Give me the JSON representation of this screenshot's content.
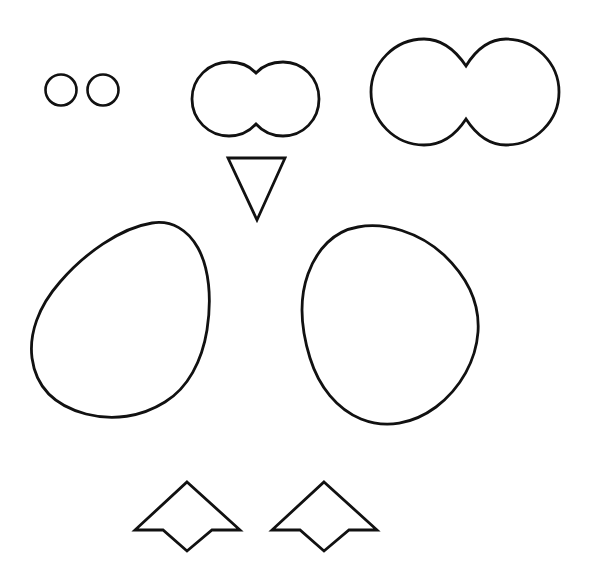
{
  "canvas": {
    "width": 592,
    "height": 586,
    "background": "#ffffff",
    "stroke_color": "#111111",
    "fill_color": "#ffffff",
    "stroke_width": 2.6,
    "title": "Outline Shapes Figure"
  },
  "shapes": [
    {
      "name": "small-circle-left",
      "type": "circle",
      "cx": 61,
      "cy": 90,
      "r": 15.5,
      "stroke_width": 2.6
    },
    {
      "name": "small-circle-right",
      "type": "circle",
      "cx": 103,
      "cy": 90,
      "r": 15.5,
      "stroke_width": 2.6
    },
    {
      "name": "medium-peanut",
      "type": "path",
      "stroke_width": 2.8,
      "d": "M 256 73 C 248 64 238 62 229 62 C 209 62 192 78 192 99 C 192 120 209 136 229 136 C 239 136 248 133 256 124 C 264 133 273 136 283 136 C 303 136 319 120 319 99 C 319 78 303 62 283 62 C 273 62 264 64 256 73 Z"
    },
    {
      "name": "large-peanut",
      "type": "path",
      "stroke_width": 2.8,
      "d": "M 466 66 C 454 48 439 39 424 39 C 395 39 371 63 371 92 C 371 121 395 145 424 145 C 440 145 455 136 466 119 C 477 136 491 145 506 145 C 535 145 559 121 559 92 C 559 63 535 39 506 39 C 491 39 477 48 466 66 Z"
    },
    {
      "name": "down-triangle",
      "type": "polygon",
      "points": "228,158 285,158 257,220",
      "stroke_width": 2.8
    },
    {
      "name": "left-blob",
      "type": "path",
      "stroke_width": 2.8,
      "d": "M 152 223 C 120 228 84 254 60 282 C 38 307 29 334 32 358 C 36 388 56 406 86 414 C 113 421 141 417 165 402 C 188 388 202 361 207 330 C 212 298 209 268 198 248 C 188 230 172 220 152 223 Z"
    },
    {
      "name": "right-blob",
      "type": "path",
      "stroke_width": 2.8,
      "d": "M 358 227 C 334 231 317 249 308 274 C 299 299 301 329 310 358 C 319 387 337 409 361 419 C 386 429 413 424 436 407 C 461 388 476 360 478 332 C 480 303 467 277 444 255 C 419 232 385 222 358 227 Z"
    },
    {
      "name": "left-dart",
      "type": "polygon",
      "points": "187,482 240,530 212,530 187,551 163,530 135,530",
      "stroke_width": 2.8
    },
    {
      "name": "right-dart",
      "type": "polygon",
      "points": "324,482 377,530 349,530 324,551 300,530 272,530",
      "stroke_width": 2.8
    }
  ]
}
